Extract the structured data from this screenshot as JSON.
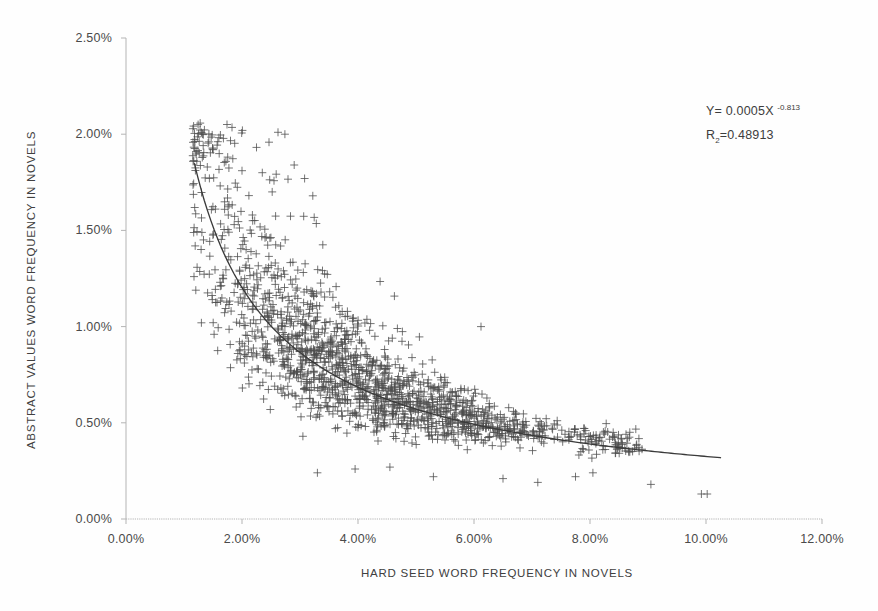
{
  "chart_data": {
    "type": "scatter",
    "title": "",
    "xlabel": "HARD SEED WORD FREQUENCY IN NOVELS",
    "ylabel": "ABSTRACT VALUES WORD FREQUENCY IN NOVELS",
    "xlim": [
      0,
      12
    ],
    "ylim": [
      0,
      2.5
    ],
    "x_tick_labels": [
      "0.00%",
      "2.00%",
      "4.00%",
      "6.00%",
      "8.00%",
      "10.00%",
      "12.00%"
    ],
    "x_tick_values": [
      0,
      2,
      4,
      6,
      8,
      10,
      12
    ],
    "y_tick_labels": [
      "0.00%",
      "0.50%",
      "1.00%",
      "1.50%",
      "2.00%",
      "2.50%"
    ],
    "y_tick_values": [
      0,
      0.5,
      1.0,
      1.5,
      2.0,
      2.5
    ],
    "grid": false,
    "legend": null,
    "marker": "plus",
    "marker_color": "#4d4d4d",
    "marker_size_px": 8,
    "n_points": 1600,
    "annotations": [
      {
        "text_parts": {
          "prefix": "Y= 0.0005X ",
          "exponent": "-0.813"
        },
        "x_pct": 80.5,
        "y_pct": 15.7
      },
      {
        "text_parts": {
          "prefix": "R",
          "subscript": "2",
          "suffix": "=0.48913"
        },
        "x_pct": 80.5,
        "y_pct": 19.6
      }
    ],
    "trendline": {
      "type": "power",
      "coefficient": 0.0005,
      "exponent": -0.813,
      "equation_label": "Y= 0.0005X^-0.813",
      "r_squared_label": "R2=0.48913",
      "r_squared": 0.48913,
      "color": "#3a3a3a",
      "x_start": 1.18,
      "x_end": 10.25,
      "y_start": 1.73,
      "y_end": 0.32
    },
    "cloud_model": {
      "comment": "Deterministic synthetic cloud matching the scanned scatter: x ~ skewed toward 3-6%, y ~ power-law mean with lognormal scatter narrowing at high x.",
      "seed": 20240917,
      "x_min": 1.15,
      "x_max": 8.9,
      "x_mode": 4.0,
      "x_skew": 1.45,
      "mean_a": 0.00052,
      "mean_b": -0.813,
      "sigma_base": 0.3,
      "sigma_decay": 0.085,
      "y_clip_min": 0.16,
      "y_clip_max": 2.06
    },
    "outliers": [
      {
        "x": 1.3,
        "y": 1.02
      },
      {
        "x": 2.62,
        "y": 2.01
      },
      {
        "x": 2.74,
        "y": 2.0
      },
      {
        "x": 2.35,
        "y": 1.8
      },
      {
        "x": 2.9,
        "y": 1.84
      },
      {
        "x": 3.08,
        "y": 1.77
      },
      {
        "x": 2.52,
        "y": 1.7
      },
      {
        "x": 3.22,
        "y": 1.68
      },
      {
        "x": 2.18,
        "y": 1.58
      },
      {
        "x": 6.12,
        "y": 1.0
      },
      {
        "x": 9.92,
        "y": 0.13
      },
      {
        "x": 10.02,
        "y": 0.13
      },
      {
        "x": 9.05,
        "y": 0.18
      },
      {
        "x": 8.4,
        "y": 0.45
      },
      {
        "x": 8.62,
        "y": 0.44
      },
      {
        "x": 8.05,
        "y": 0.24
      },
      {
        "x": 7.75,
        "y": 0.22
      },
      {
        "x": 8.22,
        "y": 0.36
      },
      {
        "x": 3.3,
        "y": 0.24
      },
      {
        "x": 3.95,
        "y": 0.26
      },
      {
        "x": 4.55,
        "y": 0.27
      },
      {
        "x": 5.3,
        "y": 0.22
      },
      {
        "x": 6.5,
        "y": 0.21
      },
      {
        "x": 7.1,
        "y": 0.19
      }
    ]
  },
  "axis": {
    "line_color": "#b4b4b4",
    "tick_color": "#b4b4b4"
  },
  "geometry": {
    "plot_left": 126,
    "plot_right": 822,
    "plot_top": 38,
    "plot_bottom": 519
  }
}
